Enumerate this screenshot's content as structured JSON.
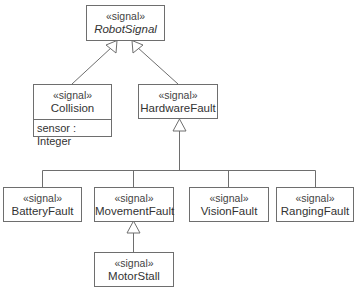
{
  "diagram": {
    "type": "UML class diagram",
    "stroke_color": "#6e6e6e",
    "classes": [
      {
        "id": "robot_signal",
        "stereotype": "«signal»",
        "name": "RobotSignal",
        "abstract": true,
        "attributes": []
      },
      {
        "id": "collision",
        "stereotype": "«signal»",
        "name": "Collision",
        "abstract": false,
        "attributes": [
          "sensor : Integer"
        ]
      },
      {
        "id": "hardware_fault",
        "stereotype": "«signal»",
        "name": "HardwareFault",
        "abstract": false,
        "attributes": []
      },
      {
        "id": "battery_fault",
        "stereotype": "«signal»",
        "name": "BatteryFault",
        "abstract": false,
        "attributes": []
      },
      {
        "id": "movement_fault",
        "stereotype": "«signal»",
        "name": "MovementFault",
        "abstract": false,
        "attributes": []
      },
      {
        "id": "vision_fault",
        "stereotype": "«signal»",
        "name": "VisionFault",
        "abstract": false,
        "attributes": []
      },
      {
        "id": "ranging_fault",
        "stereotype": "«signal»",
        "name": "RangingFault",
        "abstract": false,
        "attributes": []
      },
      {
        "id": "motor_stall",
        "stereotype": "«signal»",
        "name": "MotorStall",
        "abstract": false,
        "attributes": []
      }
    ],
    "generalizations": [
      {
        "child": "Collision",
        "parent": "RobotSignal"
      },
      {
        "child": "HardwareFault",
        "parent": "RobotSignal"
      },
      {
        "child": "BatteryFault",
        "parent": "HardwareFault"
      },
      {
        "child": "MovementFault",
        "parent": "HardwareFault"
      },
      {
        "child": "VisionFault",
        "parent": "HardwareFault"
      },
      {
        "child": "RangingFault",
        "parent": "HardwareFault"
      },
      {
        "child": "MotorStall",
        "parent": "MovementFault"
      }
    ]
  }
}
